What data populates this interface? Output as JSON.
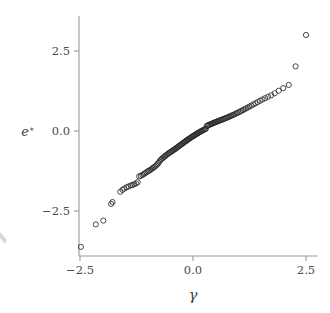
{
  "figure": {
    "background": "#ffffff",
    "marker_color": "#2b2b2b",
    "axis_color": "#9a9a9a",
    "width": 330,
    "height": 313
  },
  "axes": {
    "x": {
      "label": "γ",
      "label_name": "gamma",
      "ticks": [
        {
          "value": -2.5,
          "label": "−2.5",
          "px": 80
        },
        {
          "value": 0.0,
          "label": "0.0",
          "px": 193
        },
        {
          "value": 2.5,
          "label": "2.5",
          "px": 306
        }
      ],
      "range": [
        -2.72,
        2.78
      ],
      "spine_px": {
        "y": 256,
        "x0": 79,
        "x1": 318
      }
    },
    "y": {
      "label": "e*",
      "label_base": "e",
      "label_superscript": "∗",
      "ticks": [
        {
          "value": 2.5,
          "label": "2.5",
          "px": 51
        },
        {
          "value": 0.0,
          "label": "0.0",
          "px": 131
        },
        {
          "value": -2.5,
          "label": "−2.5",
          "px": 211
        }
      ],
      "range": [
        -3.95,
        3.55
      ],
      "spine_px": {
        "x": 79,
        "y0": 16,
        "y1": 256
      }
    },
    "grid": "off",
    "legend": "none"
  },
  "chart_data": {
    "type": "scatter",
    "title": "",
    "subtitle": "",
    "xlabel": "γ",
    "ylabel": "e*",
    "xlim": [
      -2.72,
      2.78
    ],
    "ylim": [
      -3.95,
      3.55
    ],
    "grid": false,
    "legend_position": "none",
    "marker": {
      "shape": "open-circle",
      "radius_px": 2.6,
      "stroke": "#2b2b2b",
      "fill": "none"
    },
    "series": [
      {
        "name": "normal quantile residuals",
        "n_points": 152,
        "x": [
          -2.48,
          -2.15,
          -1.985,
          -1.81,
          -1.78,
          -1.61,
          -1.56,
          -1.52,
          -1.47,
          -1.43,
          -1.38,
          -1.34,
          -1.3,
          -1.26,
          -1.225,
          -1.19,
          -1.155,
          -1.12,
          -1.09,
          -1.06,
          -1.03,
          -1.0,
          -0.972,
          -0.945,
          -0.918,
          -0.892,
          -0.866,
          -0.84,
          -0.815,
          -0.79,
          -0.766,
          -0.742,
          -0.718,
          -0.695,
          -0.672,
          -0.649,
          -0.627,
          -0.605,
          -0.583,
          -0.561,
          -0.54,
          -0.519,
          -0.498,
          -0.477,
          -0.456,
          -0.436,
          -0.416,
          -0.396,
          -0.376,
          -0.356,
          -0.337,
          -0.317,
          -0.298,
          -0.279,
          -0.26,
          -0.241,
          -0.222,
          -0.204,
          -0.185,
          -0.167,
          -0.148,
          -0.13,
          -0.112,
          -0.094,
          -0.076,
          -0.058,
          -0.04,
          -0.022,
          -0.004,
          0.014,
          0.032,
          0.05,
          0.068,
          0.086,
          0.104,
          0.122,
          0.14,
          0.158,
          0.176,
          0.194,
          0.213,
          0.231,
          0.25,
          0.268,
          0.287,
          0.306,
          0.325,
          0.344,
          0.364,
          0.383,
          0.403,
          0.423,
          0.443,
          0.463,
          0.484,
          0.505,
          0.526,
          0.547,
          0.569,
          0.591,
          0.613,
          0.636,
          0.659,
          0.682,
          0.706,
          0.73,
          0.755,
          0.78,
          0.806,
          0.832,
          0.859,
          0.887,
          0.915,
          0.944,
          0.974,
          1.005,
          1.036,
          1.069,
          1.103,
          1.138,
          1.174,
          1.212,
          1.251,
          1.293,
          1.336,
          1.382,
          1.43,
          1.482,
          1.537,
          1.596,
          1.66,
          1.73,
          1.808,
          1.896,
          1.997,
          2.118,
          2.27,
          2.5
        ],
        "y": [
          -3.62,
          -2.92,
          -2.8,
          -2.28,
          -2.22,
          -1.9,
          -1.84,
          -1.8,
          -1.76,
          -1.735,
          -1.7,
          -1.69,
          -1.66,
          -1.64,
          -1.6,
          -1.42,
          -1.4,
          -1.375,
          -1.345,
          -1.32,
          -1.29,
          -1.26,
          -1.24,
          -1.215,
          -1.19,
          -1.16,
          -1.135,
          -1.11,
          -1.075,
          -1.04,
          -1.0,
          -0.955,
          -0.905,
          -0.875,
          -0.85,
          -0.82,
          -0.795,
          -0.77,
          -0.745,
          -0.72,
          -0.698,
          -0.678,
          -0.658,
          -0.64,
          -0.62,
          -0.6,
          -0.582,
          -0.562,
          -0.54,
          -0.52,
          -0.5,
          -0.478,
          -0.458,
          -0.438,
          -0.42,
          -0.4,
          -0.382,
          -0.362,
          -0.342,
          -0.322,
          -0.302,
          -0.285,
          -0.268,
          -0.25,
          -0.232,
          -0.215,
          -0.198,
          -0.182,
          -0.166,
          -0.15,
          -0.134,
          -0.118,
          -0.102,
          -0.086,
          -0.07,
          -0.055,
          -0.04,
          -0.025,
          -0.01,
          0.004,
          0.018,
          0.032,
          0.046,
          0.06,
          0.073,
          0.16,
          0.172,
          0.184,
          0.196,
          0.208,
          0.22,
          0.232,
          0.244,
          0.256,
          0.268,
          0.28,
          0.292,
          0.304,
          0.316,
          0.328,
          0.34,
          0.352,
          0.364,
          0.378,
          0.392,
          0.406,
          0.42,
          0.436,
          0.452,
          0.468,
          0.484,
          0.502,
          0.52,
          0.54,
          0.56,
          0.582,
          0.604,
          0.628,
          0.652,
          0.678,
          0.706,
          0.734,
          0.764,
          0.796,
          0.83,
          0.866,
          0.904,
          0.944,
          0.984,
          1.026,
          1.07,
          1.116,
          1.18,
          1.26,
          1.34,
          1.44,
          2.02,
          3.0
        ]
      }
    ]
  }
}
